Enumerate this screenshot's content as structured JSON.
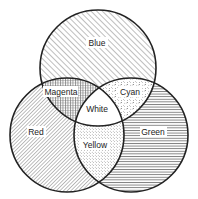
{
  "diagram": {
    "type": "venn",
    "title": "",
    "circles": [
      {
        "id": "blue",
        "label": "Blue",
        "pattern": "diagonal-hatch"
      },
      {
        "id": "red",
        "label": "Red",
        "pattern": "dense-diagonal-hatch"
      },
      {
        "id": "green",
        "label": "Green",
        "pattern": "horizontal-lines"
      }
    ],
    "intersections": [
      {
        "sets": [
          "blue",
          "red"
        ],
        "label": "Magenta",
        "pattern": "grid"
      },
      {
        "sets": [
          "blue",
          "green"
        ],
        "label": "Cyan",
        "pattern": "dashes-stipple"
      },
      {
        "sets": [
          "red",
          "green"
        ],
        "label": "Yellow",
        "pattern": "dots"
      },
      {
        "sets": [
          "blue",
          "red",
          "green"
        ],
        "label": "White",
        "pattern": "none"
      }
    ],
    "colors": {
      "line": "#222222",
      "background": "#ffffff"
    }
  }
}
